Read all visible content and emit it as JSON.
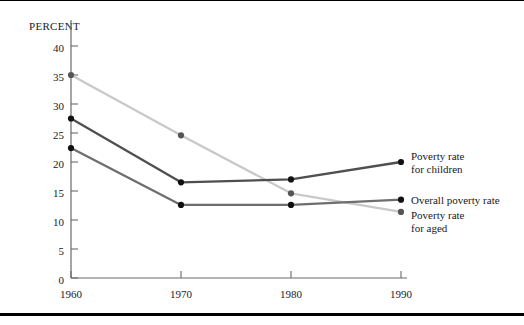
{
  "chart_data": {
    "type": "line",
    "title": "",
    "subtitle": "",
    "xlabel": "",
    "ylabel": "PERCENT",
    "x": [
      1960,
      1970,
      1980,
      1990
    ],
    "xtick_labels": [
      "1960",
      "1970",
      "1980",
      "1990"
    ],
    "ytick_labels": [
      "0",
      "5",
      "10",
      "15",
      "20",
      "25",
      "30",
      "35",
      "40"
    ],
    "ytick_values": [
      0,
      5,
      10,
      15,
      20,
      25,
      30,
      35,
      40
    ],
    "xlim": [
      1960,
      1990
    ],
    "ylim": [
      0,
      42
    ],
    "grid": false,
    "legend_position": "right-end-of-line",
    "series": [
      {
        "name": "Poverty rate for children",
        "label_lines": [
          "Poverty rate",
          "for children"
        ],
        "values": [
          27.5,
          16.5,
          17.0,
          20.0
        ],
        "color": "#4f4f4f"
      },
      {
        "name": "Overall poverty rate",
        "label_lines": [
          "Overall poverty rate"
        ],
        "values": [
          22.4,
          12.6,
          12.6,
          13.5
        ],
        "color": "#6e6e6e"
      },
      {
        "name": "Poverty rate for aged",
        "label_lines": [
          "Poverty rate",
          "for aged"
        ],
        "values": [
          35.0,
          24.6,
          14.6,
          11.4
        ],
        "color": "#c9c9c9"
      }
    ]
  },
  "axis": {
    "y_title": "PERCENT"
  },
  "legend": {
    "children_line1": "Poverty rate",
    "children_line2": "for children",
    "overall_line1": "Overall poverty rate",
    "aged_line1": "Poverty rate",
    "aged_line2": "for aged"
  },
  "yticks": {
    "t0": "0",
    "t5": "5",
    "t10": "10",
    "t15": "15",
    "t20": "20",
    "t25": "25",
    "t30": "30",
    "t35": "35",
    "t40": "40"
  },
  "xticks": {
    "x1960": "1960",
    "x1970": "1970",
    "x1980": "1980",
    "x1990": "1990"
  }
}
